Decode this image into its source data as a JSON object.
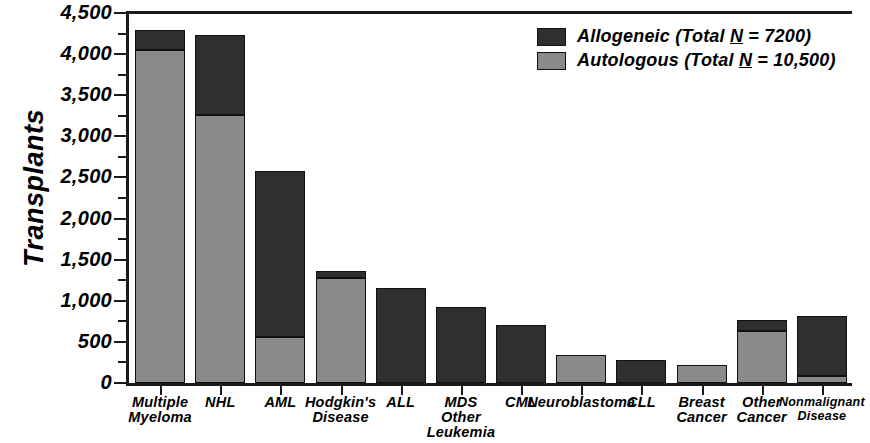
{
  "chart_data": {
    "type": "bar",
    "subtype": "stacked-vertical",
    "title": "",
    "xlabel": "",
    "ylabel": "Transplants",
    "ylim": [
      0,
      4500
    ],
    "ytick_step": 500,
    "yminor_step": 250,
    "grid": false,
    "legend_position": "top-right",
    "categories": [
      "Multiple Myeloma",
      "NHL",
      "AML",
      "Hodgkin's Disease",
      "ALL",
      "MDS Other Leukemia",
      "CML",
      "Neuroblastoma",
      "CLL",
      "Breast Cancer",
      "Other Cancer",
      "Nonmalignant Disease"
    ],
    "category_label_lines": [
      [
        "Multiple",
        "Myeloma"
      ],
      [
        "NHL"
      ],
      [
        "AML"
      ],
      [
        "Hodgkin's",
        "Disease"
      ],
      [
        "ALL"
      ],
      [
        "MDS",
        "Other",
        "Leukemia"
      ],
      [
        "CML"
      ],
      [
        "Neuroblastoma"
      ],
      [
        "CLL"
      ],
      [
        "Breast",
        "Cancer"
      ],
      [
        "Other",
        "Cancer"
      ],
      [
        "Nonmalignant",
        "Disease"
      ]
    ],
    "ytick_labels": [
      "0",
      "500",
      "1,000",
      "1,500",
      "2,000",
      "2,500",
      "3,000",
      "3,500",
      "4,000",
      "4,500"
    ],
    "ytick_values": [
      0,
      500,
      1000,
      1500,
      2000,
      2500,
      3000,
      3500,
      4000,
      4500
    ],
    "series": [
      {
        "name": "Autologous",
        "legend_label": "Autologous (Total N = 10,500)",
        "total_label": "10,500",
        "color": "#8a8a8a",
        "stack_order": 0,
        "values": [
          4050,
          3260,
          560,
          1280,
          0,
          0,
          0,
          340,
          0,
          225,
          635,
          85
        ]
      },
      {
        "name": "Allogeneic",
        "legend_label": "Allogeneic (Total N = 7200)",
        "total_label": "7200",
        "color": "#2f2f2f",
        "stack_order": 1,
        "values": [
          240,
          970,
          2020,
          80,
          1160,
          925,
          705,
          0,
          285,
          0,
          135,
          730
        ]
      }
    ],
    "totals": [
      4290,
      4230,
      2580,
      1360,
      1160,
      925,
      705,
      340,
      285,
      225,
      770,
      815
    ]
  },
  "legend": {
    "rows": [
      {
        "series": "Allogeneic",
        "prefix": "Allogeneic (Total ",
        "n_symbol": "N",
        "suffix": " = 7200)",
        "swatch": "allogeneic-swatch"
      },
      {
        "series": "Autologous",
        "prefix": "Autologous (Total ",
        "n_symbol": "N",
        "suffix": " = 10,500)",
        "swatch": "autologous-swatch"
      }
    ]
  },
  "axes": {
    "y_title": "Transplants"
  },
  "colors": {
    "allogeneic": "#2f2f2f",
    "autologous": "#8a8a8a",
    "axis": "#1a1a1a",
    "background": "#ffffff"
  }
}
